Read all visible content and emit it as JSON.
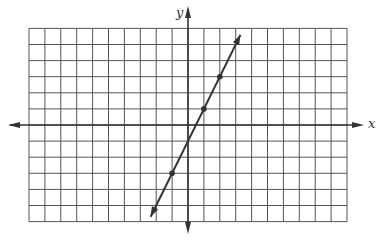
{
  "chart_data": {
    "type": "line",
    "title": "",
    "xlabel": "x",
    "ylabel": "y",
    "xlim": [
      -10,
      10
    ],
    "ylim": [
      -6,
      6
    ],
    "grid": true,
    "grid_step": 1,
    "tick_labels": false,
    "series": [
      {
        "name": "y = 2x - 1",
        "equation": "y = 2x - 1",
        "slope": 2,
        "intercept": -1,
        "marked_points": [
          [
            -1,
            -3
          ],
          [
            1,
            1
          ],
          [
            2,
            3
          ]
        ],
        "arrow_ends": [
          [
            -2.35,
            -5.7
          ],
          [
            3.3,
            5.6
          ]
        ]
      }
    ]
  },
  "axes": {
    "x_label": "x",
    "y_label": "y"
  },
  "colors": {
    "grid": "#555555",
    "axis": "#333333",
    "line": "#333333",
    "background": "#ffffff"
  }
}
